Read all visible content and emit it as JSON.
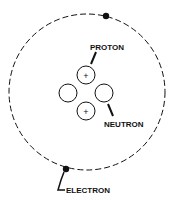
{
  "diagram": {
    "labels": {
      "proton": "PROTON",
      "neutron": "NEUTRON",
      "electron": "ELECTRON"
    },
    "proton_symbol": "+",
    "colors": {
      "line": "#111111",
      "background": "#ffffff"
    }
  }
}
